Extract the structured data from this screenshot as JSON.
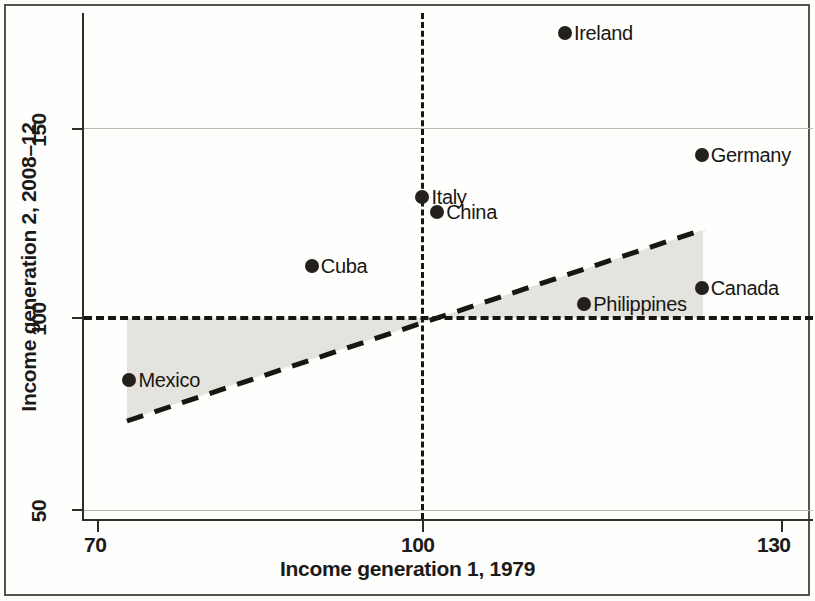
{
  "chart_data": {
    "type": "scatter",
    "title": "",
    "xlabel": "Income generation 1, 1979",
    "ylabel": "Income generation 2, 2008–12",
    "xlim": [
      70,
      130
    ],
    "ylim": [
      46,
      182
    ],
    "xticks": [
      "70",
      "100",
      "130"
    ],
    "xtick_values": [
      70,
      100,
      130
    ],
    "yticks": [
      "50",
      "100",
      "150"
    ],
    "ytick_values": [
      50,
      100,
      150
    ],
    "grid": "horizontal gridlines at y = 50 and y = 150",
    "legend": "none",
    "points": [
      {
        "label": "Ireland",
        "x": 111.0,
        "y": 175.0,
        "label_side": "right"
      },
      {
        "label": "Germany",
        "x": 123.0,
        "y": 143.0,
        "label_side": "right"
      },
      {
        "label": "Italy",
        "x": 98.5,
        "y": 132.0,
        "label_side": "right"
      },
      {
        "label": "China",
        "x": 99.8,
        "y": 128.0,
        "label_side": "right"
      },
      {
        "label": "Cuba",
        "x": 88.8,
        "y": 114.0,
        "label_side": "right"
      },
      {
        "label": "Canada",
        "x": 123.0,
        "y": 108.0,
        "label_side": "right"
      },
      {
        "label": "Philippines",
        "x": 112.7,
        "y": 104.0,
        "label_side": "right"
      },
      {
        "label": "Mexico",
        "x": 72.8,
        "y": 84.0,
        "label_side": "right"
      }
    ],
    "annotations": {
      "reference_hline": {
        "value": 100,
        "style": "dashed",
        "orientation": "horizontal"
      },
      "reference_vline": {
        "value": 100,
        "style": "dashed",
        "orientation": "vertical"
      },
      "regression_line": {
        "style": "dashed",
        "x_start": 73.0,
        "y_start": 73.0,
        "x_end": 124.0,
        "y_end": 123.0,
        "description": "upward-sloping dashed fitted line crossing (100,100)"
      },
      "shaded_region": {
        "color": "#e4e3dd",
        "description": "grey band between the y=100 reference line and the dashed fitted line, from x=73 to x=124"
      }
    },
    "colors": {
      "point": "#24201c",
      "line": "#17160f",
      "shade": "#e4e3dd",
      "grid": "#b9b9b4",
      "axis": "#2e2c29",
      "text": "#181714"
    }
  }
}
